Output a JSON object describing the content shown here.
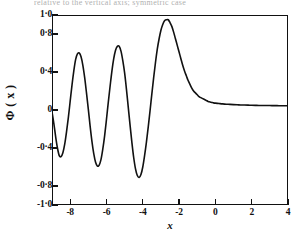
{
  "figure": {
    "caption_remnant": "relative to the vertical axis; symmetric case",
    "background_color": "#ffffff",
    "ink_color": "#111111"
  },
  "chart_data": {
    "type": "line",
    "title": "",
    "xlabel": "x",
    "ylabel": "Φ ( x )",
    "xlim": [
      -9,
      4
    ],
    "ylim": [
      -1.0,
      1.0
    ],
    "grid": false,
    "legend": null,
    "xticks": [
      -8,
      -6,
      -4,
      -2,
      0,
      2,
      4
    ],
    "xticklabels": [
      "-8",
      "-6",
      "-4",
      "-2",
      "0",
      "2",
      "4"
    ],
    "yticks": [
      1.0,
      0.8,
      0.4,
      0.0,
      -0.4,
      -0.8,
      -1.0
    ],
    "yticklabels": [
      "1·0",
      "0·8",
      "0·4",
      "0",
      "-0·4",
      "-0·8",
      "-1·0"
    ],
    "series": [
      {
        "name": "Φ(x)",
        "color": "#111111",
        "linewidth": 1.6,
        "x": [
          -9.0,
          -8.9,
          -8.8,
          -8.7,
          -8.6,
          -8.5,
          -8.4,
          -8.3,
          -8.2,
          -8.1,
          -8.0,
          -7.9,
          -7.8,
          -7.7,
          -7.6,
          -7.5,
          -7.4,
          -7.3,
          -7.2,
          -7.1,
          -7.0,
          -6.9,
          -6.8,
          -6.7,
          -6.6,
          -6.5,
          -6.4,
          -6.3,
          -6.2,
          -6.1,
          -6.0,
          -5.9,
          -5.8,
          -5.7,
          -5.6,
          -5.5,
          -5.4,
          -5.3,
          -5.2,
          -5.1,
          -5.0,
          -4.9,
          -4.8,
          -4.7,
          -4.6,
          -4.5,
          -4.4,
          -4.3,
          -4.2,
          -4.1,
          -4.0,
          -3.9,
          -3.8,
          -3.7,
          -3.6,
          -3.5,
          -3.4,
          -3.3,
          -3.2,
          -3.1,
          -3.0,
          -2.9,
          -2.8,
          -2.7,
          -2.6,
          -2.5,
          -2.4,
          -2.3,
          -2.2,
          -2.1,
          -2.0,
          -1.9,
          -1.8,
          -1.7,
          -1.6,
          -1.5,
          -1.4,
          -1.3,
          -1.2,
          -1.1,
          -1.0,
          -0.9,
          -0.8,
          -0.7,
          -0.6,
          -0.5,
          -0.4,
          -0.3,
          -0.2,
          -0.1,
          0.0,
          0.2,
          0.4,
          0.6,
          0.8,
          1.0,
          1.2,
          1.4,
          1.6,
          1.8,
          2.0,
          2.2,
          2.4,
          2.6,
          2.8,
          3.0,
          3.2,
          3.4,
          3.6,
          3.8,
          4.0
        ],
        "y": [
          -0.02,
          -0.14,
          -0.28,
          -0.4,
          -0.48,
          -0.49,
          -0.45,
          -0.36,
          -0.23,
          -0.08,
          0.09,
          0.26,
          0.41,
          0.53,
          0.59,
          0.6,
          0.56,
          0.47,
          0.34,
          0.18,
          0.01,
          -0.17,
          -0.33,
          -0.46,
          -0.55,
          -0.59,
          -0.58,
          -0.52,
          -0.41,
          -0.27,
          -0.1,
          0.08,
          0.25,
          0.41,
          0.54,
          0.63,
          0.67,
          0.67,
          0.62,
          0.52,
          0.39,
          0.22,
          0.03,
          -0.16,
          -0.34,
          -0.5,
          -0.62,
          -0.69,
          -0.71,
          -0.68,
          -0.6,
          -0.48,
          -0.34,
          -0.18,
          -0.01,
          0.17,
          0.34,
          0.5,
          0.64,
          0.75,
          0.84,
          0.9,
          0.94,
          0.95,
          0.95,
          0.92,
          0.88,
          0.82,
          0.75,
          0.68,
          0.61,
          0.54,
          0.47,
          0.41,
          0.36,
          0.31,
          0.27,
          0.23,
          0.2,
          0.18,
          0.16,
          0.14,
          0.13,
          0.12,
          0.11,
          0.1,
          0.09,
          0.085,
          0.08,
          0.075,
          0.072,
          0.068,
          0.064,
          0.061,
          0.059,
          0.057,
          0.055,
          0.053,
          0.052,
          0.051,
          0.05,
          0.049,
          0.048,
          0.048,
          0.047,
          0.047,
          0.046,
          0.046,
          0.045,
          0.045,
          0.045
        ],
        "features": {
          "minima": [
            {
              "x": -8.55,
              "y": -0.49
            },
            {
              "x": -6.45,
              "y": -0.59
            },
            {
              "x": -4.25,
              "y": -0.71
            }
          ],
          "maxima": [
            {
              "x": -7.5,
              "y": 0.6
            },
            {
              "x": -5.35,
              "y": 0.67
            },
            {
              "x": -1.05,
              "y": 0.95
            }
          ],
          "asymptote": 0.045
        }
      }
    ]
  }
}
